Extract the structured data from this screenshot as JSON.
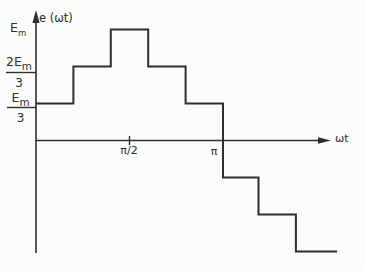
{
  "figure": {
    "paper_color": "#fbfbf9",
    "ink_color": "#2e2e2e"
  },
  "axes": {
    "y": {
      "label": "e (ωt)",
      "ticks": {
        "em": {
          "coef": "",
          "base": "E",
          "sub": "m",
          "den": ""
        },
        "two_thirds": {
          "coef": "2",
          "base": "E",
          "sub": "m",
          "den": "3"
        },
        "one_third": {
          "coef": "",
          "base": "E",
          "sub": "m",
          "den": "3"
        }
      }
    },
    "x": {
      "label": "ωt",
      "ticks": {
        "half_pi": "π/2",
        "pi": "π"
      }
    }
  },
  "chart_data": {
    "type": "line",
    "subtype": "staircase-step-waveform",
    "title": "",
    "xlabel": "ωt",
    "ylabel": "e (ωt)",
    "x_tick_labels": [
      "π/2",
      "π"
    ],
    "y_tick_labels": [
      "Em/3",
      "2Em/3",
      "Em"
    ],
    "x_range_pi": [
      0,
      1.61
    ],
    "ylim_em": [
      -1,
      1
    ],
    "grid": false,
    "legend": false,
    "steps": [
      {
        "x_start_pi": 0.0,
        "x_end_pi": 0.2,
        "y_em": 0.3333,
        "label": "Em/3"
      },
      {
        "x_start_pi": 0.2,
        "x_end_pi": 0.4,
        "y_em": 0.6667,
        "label": "2Em/3"
      },
      {
        "x_start_pi": 0.4,
        "x_end_pi": 0.6,
        "y_em": 1.0,
        "label": "Em"
      },
      {
        "x_start_pi": 0.6,
        "x_end_pi": 0.8,
        "y_em": 0.6667,
        "label": "2Em/3"
      },
      {
        "x_start_pi": 0.8,
        "x_end_pi": 1.0,
        "y_em": 0.3333,
        "label": "Em/3"
      },
      {
        "x_start_pi": 1.0,
        "x_end_pi": 1.19,
        "y_em": -0.3333,
        "label": "-Em/3"
      },
      {
        "x_start_pi": 1.19,
        "x_end_pi": 1.39,
        "y_em": -0.6667,
        "label": "-2Em/3"
      },
      {
        "x_start_pi": 1.39,
        "x_end_pi": 1.61,
        "y_em": -1.0,
        "label": "-Em"
      }
    ]
  }
}
